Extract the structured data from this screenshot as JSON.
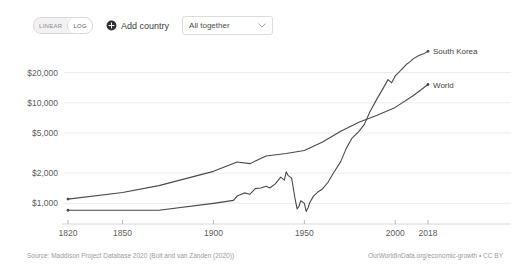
{
  "toolbar": {
    "scale_options": [
      {
        "label": "LINEAR",
        "active": false
      },
      {
        "label": "LOG",
        "active": true
      }
    ],
    "add_country_label": "Add country",
    "add_country_icon": "plus-circle-icon",
    "country_select_value": "All together",
    "country_select_icon": "chevron-down-icon"
  },
  "footer": {
    "source": "Source: Maddison Project Database 2020 (Bolt and van Zanden (2020))",
    "credit": "OurWorldInData.org/economic-growth • CC BY"
  },
  "chart_data": {
    "type": "line",
    "title": "",
    "subtitle": "",
    "xlabel": "",
    "ylabel": "",
    "yscale": "log",
    "xscale": "linear",
    "grid": true,
    "legend": "inline-right-endpoint",
    "xlim": [
      1820,
      2018
    ],
    "ylim": [
      820,
      32000
    ],
    "y_ticks": [
      1000,
      2000,
      5000,
      10000,
      20000
    ],
    "y_tick_labels": [
      "$1,000",
      "$2,000",
      "$5,000",
      "$10,000",
      "$20,000"
    ],
    "x_ticks": [
      1820,
      1850,
      1900,
      1950,
      2000,
      2018
    ],
    "x_tick_labels": [
      "1820",
      "1850",
      "1900",
      "1950",
      "2000",
      "2018"
    ],
    "line_color": "#4a4a4a",
    "series": [
      {
        "name": "World",
        "label": "World",
        "color": "#4a4a4a",
        "x": [
          1820,
          1850,
          1870,
          1900,
          1913,
          1920,
          1929,
          1940,
          1950,
          1960,
          1970,
          1980,
          1990,
          2000,
          2010,
          2018
        ],
        "values": [
          1102,
          1280,
          1500,
          2080,
          2580,
          2480,
          2960,
          3130,
          3350,
          4080,
          5200,
          6400,
          7500,
          9000,
          11800,
          15200
        ]
      },
      {
        "name": "South Korea",
        "label": "South Korea",
        "color": "#4a4a4a",
        "x": [
          1820,
          1850,
          1870,
          1900,
          1911,
          1913,
          1917,
          1920,
          1923,
          1926,
          1929,
          1931,
          1934,
          1937,
          1939,
          1940,
          1941,
          1943,
          1945,
          1946,
          1947,
          1948,
          1950,
          1951,
          1952,
          1953,
          1955,
          1958,
          1960,
          1963,
          1966,
          1970,
          1973,
          1976,
          1980,
          1983,
          1986,
          1990,
          1993,
          1996,
          1998,
          2000,
          2003,
          2006,
          2008,
          2010,
          2013,
          2016,
          2018
        ],
        "values": [
          854,
          854,
          854,
          1000,
          1070,
          1180,
          1270,
          1230,
          1400,
          1420,
          1480,
          1420,
          1560,
          1820,
          1700,
          2060,
          1900,
          1780,
          1080,
          880,
          930,
          1060,
          1000,
          830,
          900,
          1020,
          1180,
          1320,
          1390,
          1620,
          2000,
          2600,
          3500,
          4400,
          5200,
          6100,
          8100,
          11000,
          13600,
          17000,
          15800,
          18500,
          21000,
          24000,
          25500,
          27500,
          29500,
          31000,
          32500
        ]
      }
    ],
    "annotations": [
      {
        "text": "South Korea",
        "x": 2018,
        "y": 32500,
        "position": "right-of-endpoint"
      },
      {
        "text": "World",
        "x": 2018,
        "y": 15200,
        "position": "right-of-endpoint"
      }
    ]
  }
}
